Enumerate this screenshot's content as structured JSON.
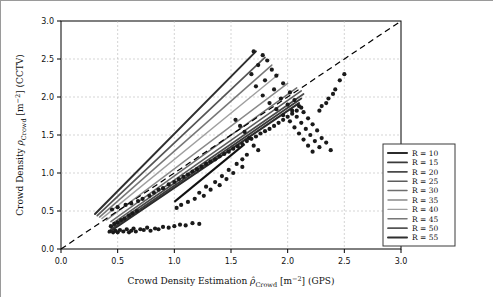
{
  "chart_data": {
    "type": "scatter",
    "title": "",
    "xlabel": "Crowd Density Estimation  ρ̂Crowd [m−2] (GPS)",
    "ylabel": "Crowd Density ρCrowd [m−2] (CCTV)",
    "xlim": [
      0.0,
      3.0
    ],
    "ylim": [
      0.0,
      3.0
    ],
    "xticks": [
      "0.0",
      "0.5",
      "1.0",
      "1.5",
      "2.0",
      "2.5",
      "3.0"
    ],
    "yticks": [
      "0.0",
      "0.5",
      "1.0",
      "1.5",
      "2.0",
      "2.5",
      "3.0"
    ],
    "grid": true,
    "legend_position": "lower right",
    "legend_title": "",
    "series": [
      {
        "name": "R = 10",
        "color": "#2b2b2b",
        "width": 2.1,
        "line": [
          [
            0.42,
            0.22
          ],
          [
            2.1,
            1.92
          ]
        ]
      },
      {
        "name": "R = 15",
        "color": "#3a3a3a",
        "width": 1.9,
        "line": [
          [
            0.44,
            0.26
          ],
          [
            2.12,
            1.98
          ]
        ]
      },
      {
        "name": "R = 20",
        "color": "#4a4a4a",
        "width": 1.7,
        "line": [
          [
            0.45,
            0.3
          ],
          [
            2.14,
            2.04
          ]
        ]
      },
      {
        "name": "R = 25",
        "color": "#5d5d5d",
        "width": 1.6,
        "line": [
          [
            0.46,
            0.34
          ],
          [
            2.12,
            2.08
          ]
        ]
      },
      {
        "name": "R = 30",
        "color": "#6e6e6e",
        "width": 1.5,
        "line": [
          [
            0.44,
            0.36
          ],
          [
            2.08,
            2.12
          ]
        ]
      },
      {
        "name": "R = 35",
        "color": "#8a8a8a",
        "width": 1.4,
        "line": [
          [
            0.4,
            0.38
          ],
          [
            2.0,
            2.18
          ]
        ]
      },
      {
        "name": "R = 40",
        "color": "#a0a0a0",
        "width": 1.4,
        "line": [
          [
            0.36,
            0.4
          ],
          [
            1.92,
            2.3
          ]
        ]
      },
      {
        "name": "R = 45",
        "color": "#777777",
        "width": 1.5,
        "line": [
          [
            0.34,
            0.42
          ],
          [
            1.86,
            2.42
          ]
        ]
      },
      {
        "name": "R = 50",
        "color": "#555555",
        "width": 1.7,
        "line": [
          [
            0.32,
            0.44
          ],
          [
            1.8,
            2.52
          ]
        ]
      },
      {
        "name": "R = 55",
        "color": "#2f2f2f",
        "width": 2.0,
        "line": [
          [
            0.3,
            0.46
          ],
          [
            1.72,
            2.6
          ]
        ]
      }
    ],
    "identity_line": {
      "style": "dashed",
      "color": "#000000",
      "from": [
        0.0,
        0.0
      ],
      "to": [
        3.0,
        3.0
      ]
    },
    "extra_line": {
      "color": "#111111",
      "width": 2.0,
      "from": [
        1.0,
        0.62
      ],
      "to": [
        1.62,
        1.38
      ]
    },
    "points": [
      [
        0.43,
        0.23
      ],
      [
        0.46,
        0.22
      ],
      [
        0.48,
        0.24
      ],
      [
        0.5,
        0.22
      ],
      [
        0.52,
        0.25
      ],
      [
        0.55,
        0.23
      ],
      [
        0.58,
        0.26
      ],
      [
        0.6,
        0.22
      ],
      [
        0.62,
        0.24
      ],
      [
        0.64,
        0.27
      ],
      [
        0.66,
        0.23
      ],
      [
        0.7,
        0.26
      ],
      [
        0.73,
        0.25
      ],
      [
        0.76,
        0.28
      ],
      [
        0.79,
        0.24
      ],
      [
        0.83,
        0.27
      ],
      [
        0.86,
        0.26
      ],
      [
        0.9,
        0.29
      ],
      [
        0.95,
        0.28
      ],
      [
        1.0,
        0.3
      ],
      [
        1.05,
        0.32
      ],
      [
        1.1,
        0.31
      ],
      [
        1.16,
        0.34
      ],
      [
        1.22,
        0.33
      ],
      [
        0.44,
        0.3
      ],
      [
        0.47,
        0.33
      ],
      [
        0.5,
        0.35
      ],
      [
        0.53,
        0.38
      ],
      [
        0.56,
        0.4
      ],
      [
        0.6,
        0.44
      ],
      [
        0.63,
        0.47
      ],
      [
        0.67,
        0.5
      ],
      [
        0.45,
        0.52
      ],
      [
        0.5,
        0.55
      ],
      [
        0.57,
        0.58
      ],
      [
        0.62,
        0.6
      ],
      [
        0.68,
        0.63
      ],
      [
        0.72,
        0.66
      ],
      [
        0.78,
        0.7
      ],
      [
        0.82,
        0.74
      ],
      [
        0.86,
        0.78
      ],
      [
        0.9,
        0.8
      ],
      [
        0.95,
        0.85
      ],
      [
        1.0,
        0.88
      ],
      [
        1.04,
        0.92
      ],
      [
        1.08,
        0.95
      ],
      [
        1.12,
        0.98
      ],
      [
        1.16,
        1.02
      ],
      [
        1.2,
        1.05
      ],
      [
        1.24,
        1.08
      ],
      [
        1.28,
        1.12
      ],
      [
        1.32,
        1.15
      ],
      [
        1.36,
        1.18
      ],
      [
        1.4,
        1.22
      ],
      [
        1.44,
        1.25
      ],
      [
        1.48,
        1.28
      ],
      [
        1.52,
        1.32
      ],
      [
        1.56,
        1.35
      ],
      [
        1.6,
        1.38
      ],
      [
        1.64,
        1.42
      ],
      [
        1.68,
        1.45
      ],
      [
        1.72,
        1.48
      ],
      [
        1.76,
        1.52
      ],
      [
        1.8,
        1.55
      ],
      [
        1.84,
        1.58
      ],
      [
        1.88,
        1.62
      ],
      [
        1.92,
        1.66
      ],
      [
        1.96,
        1.7
      ],
      [
        2.0,
        1.74
      ],
      [
        2.04,
        1.78
      ],
      [
        2.08,
        1.82
      ],
      [
        2.12,
        1.86
      ],
      [
        1.7,
        2.6
      ],
      [
        1.78,
        2.55
      ],
      [
        1.82,
        2.48
      ],
      [
        1.74,
        2.42
      ],
      [
        1.86,
        2.36
      ],
      [
        1.68,
        2.3
      ],
      [
        1.9,
        2.28
      ],
      [
        1.8,
        2.22
      ],
      [
        1.96,
        2.18
      ],
      [
        1.72,
        2.14
      ],
      [
        1.88,
        2.1
      ],
      [
        2.02,
        2.06
      ],
      [
        1.78,
        2.02
      ],
      [
        1.94,
        1.98
      ],
      [
        2.06,
        1.96
      ],
      [
        1.84,
        1.92
      ],
      [
        2.0,
        1.9
      ],
      [
        2.1,
        1.88
      ],
      [
        1.9,
        1.84
      ],
      [
        2.04,
        1.82
      ],
      [
        2.14,
        1.8
      ],
      [
        1.96,
        1.76
      ],
      [
        2.08,
        1.74
      ],
      [
        2.18,
        1.72
      ],
      [
        2.02,
        1.68
      ],
      [
        2.12,
        1.66
      ],
      [
        2.22,
        1.64
      ],
      [
        2.06,
        1.6
      ],
      [
        2.16,
        1.58
      ],
      [
        2.26,
        1.56
      ],
      [
        2.1,
        1.52
      ],
      [
        2.2,
        1.5
      ],
      [
        2.3,
        1.46
      ],
      [
        2.14,
        1.44
      ],
      [
        2.24,
        1.42
      ],
      [
        2.34,
        1.4
      ],
      [
        2.18,
        1.36
      ],
      [
        2.28,
        1.34
      ],
      [
        2.38,
        1.3
      ],
      [
        2.22,
        1.28
      ],
      [
        1.55,
        1.12
      ],
      [
        1.6,
        1.08
      ],
      [
        1.48,
        1.04
      ],
      [
        1.52,
        1.0
      ],
      [
        1.42,
        0.96
      ],
      [
        1.46,
        0.92
      ],
      [
        1.36,
        0.88
      ],
      [
        1.4,
        0.84
      ],
      [
        1.28,
        0.82
      ],
      [
        1.32,
        0.78
      ],
      [
        1.22,
        0.74
      ],
      [
        1.26,
        0.7
      ],
      [
        1.18,
        0.66
      ],
      [
        1.12,
        0.62
      ],
      [
        1.06,
        0.58
      ],
      [
        1.02,
        0.54
      ],
      [
        1.66,
        1.46
      ],
      [
        1.62,
        1.54
      ],
      [
        1.58,
        1.62
      ],
      [
        1.54,
        1.7
      ],
      [
        1.7,
        1.36
      ],
      [
        1.74,
        1.3
      ],
      [
        1.64,
        1.24
      ],
      [
        1.6,
        1.18
      ],
      [
        2.42,
        2.1
      ],
      [
        2.36,
        1.98
      ],
      [
        2.3,
        1.88
      ],
      [
        2.46,
        2.22
      ],
      [
        2.4,
        2.04
      ],
      [
        2.34,
        1.92
      ],
      [
        2.28,
        1.82
      ],
      [
        2.5,
        2.3
      ]
    ]
  },
  "legend": {
    "items": [
      {
        "label": "R = 10"
      },
      {
        "label": "R = 15"
      },
      {
        "label": "R = 20"
      },
      {
        "label": "R = 25"
      },
      {
        "label": "R = 30"
      },
      {
        "label": "R = 35"
      },
      {
        "label": "R = 40"
      },
      {
        "label": "R = 45"
      },
      {
        "label": "R = 50"
      },
      {
        "label": "R = 55"
      }
    ]
  },
  "axes": {
    "x_title_main": "Crowd Density Estimation",
    "x_title_math": "ρ̂",
    "x_title_sub": "Crowd",
    "x_title_units": "[m",
    "x_title_exp": "−2",
    "x_title_tail": "] (GPS)",
    "y_title_main": "Crowd Density",
    "y_title_math": "ρ",
    "y_title_sub": "Crowd",
    "y_title_units": "[m",
    "y_title_exp": "−2",
    "y_title_tail": "] (CCTV)"
  }
}
